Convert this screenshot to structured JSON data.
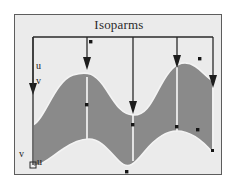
{
  "figure": {
    "title": "Isoparms",
    "background_color": "#ebebeb",
    "page_color": "#ffffff",
    "border_color": "#5d5d5d"
  },
  "labels": {
    "u_direction_left": "u",
    "v_direction_left": "v",
    "v_origin": "v",
    "u_origin": "u"
  },
  "surface": {
    "fill_color": "#8a8a8a",
    "isoparm_line_color": "#f2f2f2",
    "outline_color": "#f4f4f4",
    "upper_boundary": "M 18,110 C 30,104 40,66 58,60 C 74,55 80,60 88,70 C 98,84 104,99 118,100 C 132,101 138,84 146,70 C 154,56 160,48 170,48 C 182,48 190,62 198,66 L 198,112 L 18,112 Z",
    "lower_boundary": "M 18,152 C 28,150 36,142 48,134 C 58,127 66,124 74,124 C 86,124 94,136 104,146 C 114,156 120,148 130,136 C 140,124 150,116 162,116 C 176,116 188,126 198,138"
  },
  "bracket": {
    "line_color": "#2a2a2a",
    "top_y": 22,
    "left_x": 18,
    "right_x": 198
  },
  "isoparm_arrows": [
    {
      "name": "isoparm-arrow-1",
      "x": 18,
      "tip_y": 78,
      "curve": "left-edge"
    },
    {
      "name": "isoparm-arrow-2",
      "x": 72,
      "tip_y": 52,
      "curve": "second"
    },
    {
      "name": "isoparm-arrow-3",
      "x": 118,
      "tip_y": 96,
      "curve": "middle"
    },
    {
      "name": "isoparm-arrow-4",
      "x": 162,
      "tip_y": 50,
      "curve": "fourth"
    },
    {
      "name": "isoparm-arrow-5",
      "x": 198,
      "tip_y": 70,
      "curve": "right-edge"
    }
  ],
  "isoparm_curves": [
    {
      "name": "isoparm-curve-left",
      "x": 18,
      "y_top": 110,
      "y_bottom": 152
    },
    {
      "name": "isoparm-curve-2",
      "x": 72,
      "y_top": 62,
      "y_bottom": 124
    },
    {
      "name": "isoparm-curve-middle",
      "x": 118,
      "y_top": 100,
      "y_bottom": 146
    },
    {
      "name": "isoparm-curve-4",
      "x": 162,
      "y_top": 52,
      "y_bottom": 116
    },
    {
      "name": "isoparm-curve-right",
      "x": 198,
      "y_top": 66,
      "y_bottom": 138
    }
  ],
  "control_points": [
    {
      "name": "control-point",
      "x": 76,
      "y": 27
    },
    {
      "name": "control-point",
      "x": 72,
      "y": 90
    },
    {
      "name": "control-point",
      "x": 118,
      "y": 110
    },
    {
      "name": "control-point",
      "x": 162,
      "y": 112
    },
    {
      "name": "control-point",
      "x": 185,
      "y": 44
    },
    {
      "name": "control-point",
      "x": 183,
      "y": 115
    },
    {
      "name": "control-point",
      "x": 198,
      "y": 136
    },
    {
      "name": "control-point",
      "x": 112,
      "y": 157
    }
  ],
  "origin_marker": {
    "name": "parameter-origin-marker",
    "x": 18,
    "y": 150
  }
}
